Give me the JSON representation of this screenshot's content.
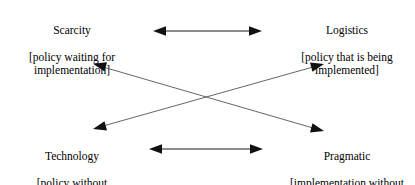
{
  "diagram": {
    "stroke_color": "#000000",
    "background_color": "#ffffff",
    "quadrants": [
      {
        "id": "scarcity",
        "term": "Scarcity",
        "gloss": "[policy waiting for implementation]",
        "position": "top-left"
      },
      {
        "id": "logistics",
        "term": "Logistics",
        "gloss": "[policy that is being implemented]",
        "position": "top-right"
      },
      {
        "id": "technology",
        "term": "Technology",
        "gloss": "[policy without implementation]",
        "position": "bottom-left"
      },
      {
        "id": "pragmatic",
        "term": "Pragmatic",
        "gloss": "[implementation without policy]",
        "position": "bottom-right"
      }
    ],
    "connectors": [
      {
        "id": "scarcity-logistics",
        "label": "Scarcity ↔ Logistics",
        "from": "scarcity",
        "to": "logistics",
        "style": "double-headed",
        "orientation": "horizontal"
      },
      {
        "id": "technology-pragmatic",
        "label": "Technology ↔ Pragmatic",
        "from": "technology",
        "to": "pragmatic",
        "style": "double-headed",
        "orientation": "horizontal"
      },
      {
        "id": "scarcity-pragmatic",
        "label": "Scarcity ↔ Pragmatic",
        "from": "scarcity",
        "to": "pragmatic",
        "style": "double-headed",
        "orientation": "diagonal"
      },
      {
        "id": "technology-logistics",
        "label": "Technology ↔ Logistics",
        "from": "technology",
        "to": "logistics",
        "style": "double-headed",
        "orientation": "diagonal"
      }
    ]
  }
}
